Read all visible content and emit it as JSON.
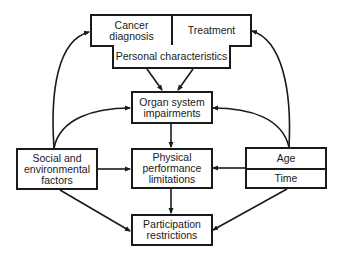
{
  "diagram": {
    "nodes": {
      "cancer_diagnosis": {
        "label": "Cancer diagnosis",
        "line1": "Cancer",
        "line2": "diagnosis"
      },
      "treatment": {
        "label": "Treatment"
      },
      "personal": {
        "label": "Personal characteristics"
      },
      "organ": {
        "label": "Organ system impairments",
        "line1": "Organ system",
        "line2": "impairments"
      },
      "social": {
        "label": "Social and environmental factors",
        "line1": "Social and",
        "line2": "environmental",
        "line3": "factors"
      },
      "physical": {
        "label": "Physical performance limitations",
        "line1": "Physical",
        "line2": "performance",
        "line3": "limitations"
      },
      "age": {
        "label": "Age"
      },
      "time": {
        "label": "Time"
      },
      "participation": {
        "label": "Participation restrictions",
        "line1": "Participation",
        "line2": "restrictions"
      }
    },
    "edges": [
      {
        "from": "personal",
        "to": "organ"
      },
      {
        "from": "personal",
        "to": "organ"
      },
      {
        "from": "organ",
        "to": "physical"
      },
      {
        "from": "physical",
        "to": "participation"
      },
      {
        "from": "social",
        "to": "cancer_diagnosis"
      },
      {
        "from": "social",
        "to": "organ"
      },
      {
        "from": "social",
        "to": "physical"
      },
      {
        "from": "social",
        "to": "participation"
      },
      {
        "from": "age_time",
        "to": "treatment"
      },
      {
        "from": "age_time",
        "to": "organ"
      },
      {
        "from": "age_time",
        "to": "physical"
      },
      {
        "from": "age_time",
        "to": "participation"
      }
    ],
    "colors": {
      "stroke": "#1a1a1a",
      "background": "#ffffff"
    }
  }
}
